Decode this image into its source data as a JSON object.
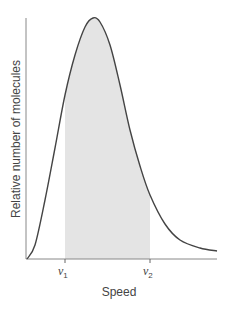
{
  "chart_data": {
    "type": "line",
    "title": "",
    "xlabel": "Speed",
    "ylabel": "Relative number of molecules",
    "x_ticks": [
      {
        "label": "v",
        "subscript": "1",
        "position": 65
      },
      {
        "label": "v",
        "subscript": "2",
        "position": 150
      }
    ],
    "shaded_region": {
      "from": "v1",
      "to": "v2",
      "color": "#e4e4e4"
    },
    "curve_color": "#444444",
    "axis_color": "#888888",
    "grid": false,
    "legend": null,
    "curve_points_px": [
      [
        27,
        259
      ],
      [
        35,
        245
      ],
      [
        45,
        200
      ],
      [
        55,
        148
      ],
      [
        65,
        95
      ],
      [
        75,
        55
      ],
      [
        85,
        27
      ],
      [
        93,
        18
      ],
      [
        100,
        22
      ],
      [
        110,
        45
      ],
      [
        120,
        85
      ],
      [
        130,
        130
      ],
      [
        140,
        166
      ],
      [
        150,
        195
      ],
      [
        165,
        224
      ],
      [
        180,
        240
      ],
      [
        200,
        248
      ],
      [
        217,
        251
      ]
    ]
  }
}
